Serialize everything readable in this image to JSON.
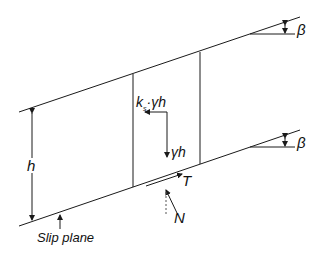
{
  "diagram": {
    "labels": {
      "beta_top": "β",
      "beta_bottom": "β",
      "seismic_force": "k",
      "seismic_subscript": "s",
      "seismic_rest": "·γh",
      "weight": "γh",
      "height": "h",
      "shear": "T",
      "normal": "N",
      "slip_plane": "Slip plane",
      "normal_angle": "β"
    },
    "colors": {
      "line": "#1a1a1a",
      "background": "#ffffff"
    }
  }
}
